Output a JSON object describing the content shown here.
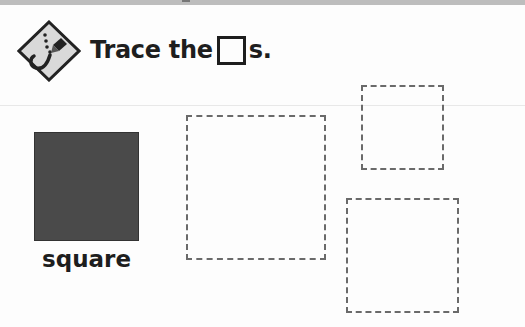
{
  "instruction": {
    "prefix": "Trace the",
    "shape_glyph": "square",
    "suffix": "s."
  },
  "icon": {
    "name": "trace-pencil-icon"
  },
  "model_shape": {
    "label": "square",
    "fill_color": "#4a4a4a"
  },
  "trace_shapes": [
    {
      "name": "trace-square-large",
      "x": 186,
      "y": 115,
      "w": 140,
      "h": 145
    },
    {
      "name": "trace-square-small",
      "x": 361,
      "y": 85,
      "w": 83,
      "h": 85
    },
    {
      "name": "trace-square-medium",
      "x": 346,
      "y": 198,
      "w": 113,
      "h": 115
    }
  ],
  "colors": {
    "dash": "#6a6a6a",
    "text": "#1e1e1e"
  }
}
